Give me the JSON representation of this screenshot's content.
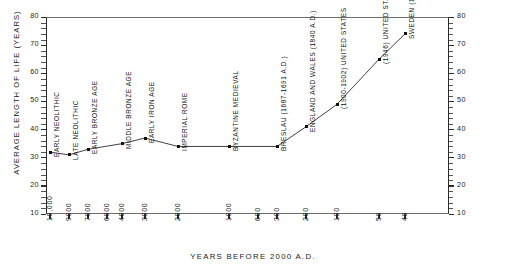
{
  "chart_data": {
    "type": "line",
    "title": "",
    "xlabel": "YEARS BEFORE 2000 A.D.",
    "ylabel": "AVERAGE LENGTH OF LIFE (YEARS)",
    "ylim": [
      10,
      80
    ],
    "y_ticks": [
      10,
      20,
      30,
      40,
      50,
      60,
      70,
      80
    ],
    "y_axis_right": true,
    "x_scale": "log-reversed",
    "x_ticks": [
      "10,000",
      "9000",
      "7000",
      "6000",
      "4000",
      "3000",
      "2000",
      "1000",
      "600",
      "300",
      "200",
      "100",
      "50",
      "40"
    ],
    "grid": false,
    "legend": "none",
    "categories": [
      "EARLY NEOLITHIC",
      "LATE NEOLITHIC",
      "EARLY BRONZE AGE",
      "MIDDLE BRONZE AGE",
      "EARLY IRON AGE",
      "IMPERIAL ROME",
      "BYZANTINE MEDIEVAL",
      "BRESLAU (1687-1691 A.D.)",
      "ENGLAND AND WALES (1840 A.D.)",
      "(1900-1902) UNITED STATES",
      "(1946) UNITED STATES",
      "SWEDEN (1961-1965)"
    ],
    "values": [
      32,
      31,
      33,
      35,
      37,
      34,
      34,
      34,
      41,
      49,
      65,
      74
    ],
    "points": [
      {
        "label": "EARLY NEOLITHIC",
        "x_px": 50,
        "value": 32
      },
      {
        "label": "LATE NEOLITHIC",
        "x_px": 69,
        "value": 31
      },
      {
        "label": "EARLY BRONZE AGE",
        "x_px": 88,
        "value": 33
      },
      {
        "label": "MIDDLE BRONZE AGE",
        "x_px": 122,
        "value": 35
      },
      {
        "label": "EARLY IRON AGE",
        "x_px": 145,
        "value": 37
      },
      {
        "label": "IMPERIAL ROME",
        "x_px": 178,
        "value": 34
      },
      {
        "label": "BYZANTINE MEDIEVAL",
        "x_px": 229,
        "value": 34
      },
      {
        "label": "BRESLAU (1687-1691 A.D.)",
        "x_px": 277,
        "value": 34
      },
      {
        "label": "ENGLAND AND WALES (1840 A.D.)",
        "x_px": 306,
        "value": 41
      },
      {
        "label": "(1900-1902) UNITED STATES",
        "x_px": 337,
        "value": 49
      },
      {
        "label": "(1946) UNITED STATES",
        "x_px": 379,
        "value": 65
      },
      {
        "label": "SWEDEN (1961-1965)",
        "x_px": 405,
        "value": 74
      }
    ]
  }
}
